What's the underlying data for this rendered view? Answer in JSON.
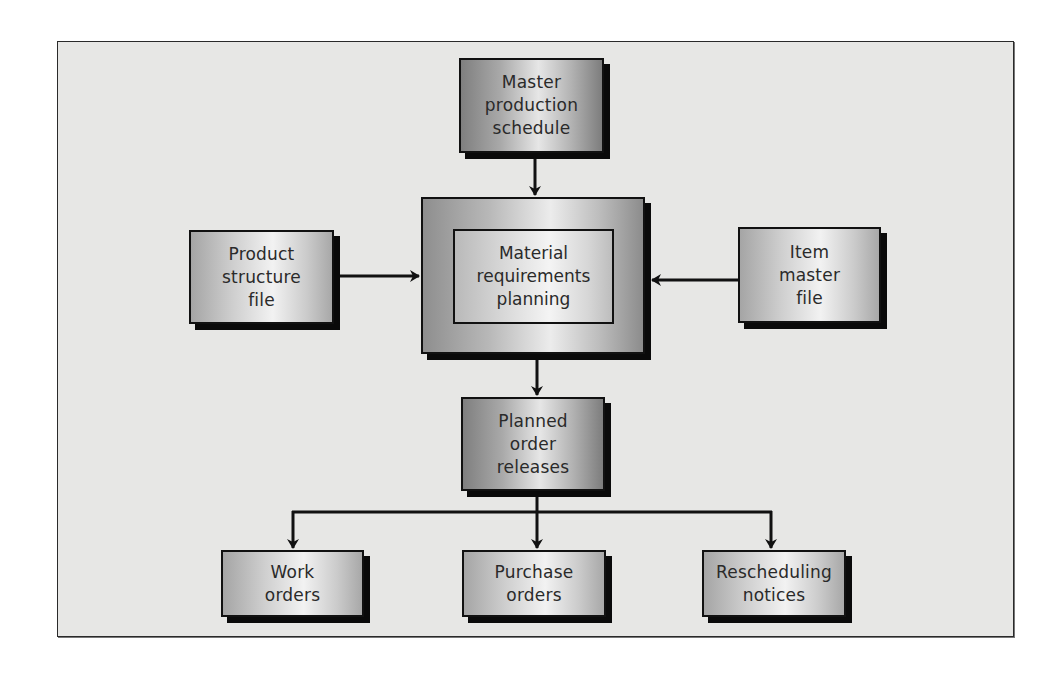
{
  "diagram": {
    "type": "flowchart",
    "nodes": {
      "master_schedule": {
        "label": "Master\nproduction\nschedule"
      },
      "product_structure": {
        "label": "Product\nstructure\nfile"
      },
      "mrp": {
        "label": "Material\nrequirements\nplanning"
      },
      "item_master": {
        "label": "Item\nmaster\nfile"
      },
      "planned_orders": {
        "label": "Planned\norder\nreleases"
      },
      "work_orders": {
        "label": "Work\norders"
      },
      "purchase_orders": {
        "label": "Purchase\norders"
      },
      "rescheduling": {
        "label": "Rescheduling\nnotices"
      }
    },
    "edges": [
      {
        "from": "Master production schedule",
        "to": "Material requirements planning"
      },
      {
        "from": "Product structure file",
        "to": "Material requirements planning"
      },
      {
        "from": "Item master file",
        "to": "Material requirements planning"
      },
      {
        "from": "Material requirements planning",
        "to": "Planned order releases"
      },
      {
        "from": "Planned order releases",
        "to": "Work orders"
      },
      {
        "from": "Planned order releases",
        "to": "Purchase orders"
      },
      {
        "from": "Planned order releases",
        "to": "Rescheduling notices"
      }
    ],
    "colors": {
      "frame_bg": "#e7e7e5",
      "border": "#111111",
      "shadow": "#0a0a0a",
      "text": "#2a2a2a",
      "page_bg": "#ffffff"
    }
  }
}
